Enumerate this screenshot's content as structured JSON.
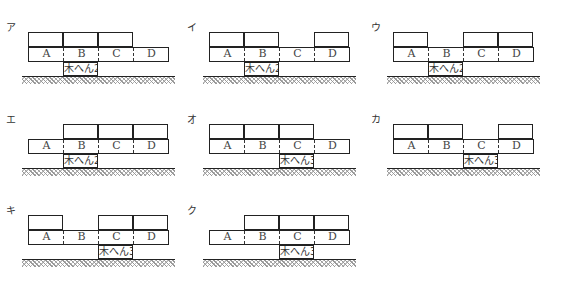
{
  "diagram": {
    "cell_labels": [
      "A",
      "B",
      "C",
      "D"
    ],
    "panels": [
      {
        "label": "ア",
        "top_blocks": [
          "A",
          "B",
          "C"
        ],
        "support_under": "B",
        "support_text": "木へん2"
      },
      {
        "label": "イ",
        "top_blocks": [
          "A",
          "B",
          "D"
        ],
        "support_under": "B",
        "support_text": "木へん2"
      },
      {
        "label": "ウ",
        "top_blocks": [
          "A",
          "C",
          "D"
        ],
        "support_under": "B",
        "support_text": "木へん2"
      },
      {
        "label": "エ",
        "top_blocks": [
          "B",
          "C",
          "D"
        ],
        "support_under": "B",
        "support_text": "木へん2"
      },
      {
        "label": "オ",
        "top_blocks": [
          "A",
          "B",
          "C"
        ],
        "support_under": "C",
        "support_text": "木へん3"
      },
      {
        "label": "カ",
        "top_blocks": [
          "A",
          "B",
          "D"
        ],
        "support_under": "C",
        "support_text": "木へん3"
      },
      {
        "label": "キ",
        "top_blocks": [
          "A",
          "C",
          "D"
        ],
        "support_under": "C",
        "support_text": "木へん3"
      },
      {
        "label": "ク",
        "top_blocks": [
          "B",
          "C",
          "D"
        ],
        "support_under": "C",
        "support_text": "木へん3"
      }
    ]
  }
}
